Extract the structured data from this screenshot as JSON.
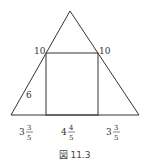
{
  "figure": {
    "caption": "図 11.3",
    "shapes": {
      "triangle": {
        "apex": [
          70,
          11
        ],
        "base_left": [
          11,
          115
        ],
        "base_right": [
          139,
          115
        ]
      },
      "square": {
        "left": 46,
        "right": 98,
        "top": 53,
        "bottom": 115
      }
    },
    "labels": {
      "top_left_side": "10",
      "top_right_side": "10",
      "lower_left_side": "6",
      "base_left": {
        "whole": "3",
        "num": "3",
        "den": "5"
      },
      "base_middle": {
        "whole": "4",
        "num": "4",
        "den": "5"
      },
      "base_right": {
        "whole": "3",
        "num": "3",
        "den": "5"
      }
    }
  }
}
